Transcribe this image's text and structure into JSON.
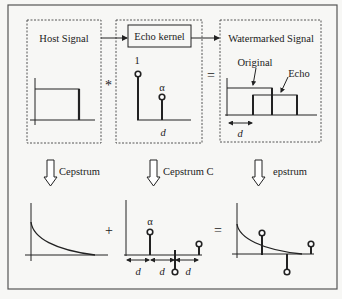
{
  "diagram": {
    "panels": {
      "host": {
        "title": "Host Signal"
      },
      "kernel": {
        "title": "Echo kernel",
        "impulse_1_label": "1",
        "impulse_alpha_label": "α",
        "delay_label": "d"
      },
      "watermarked": {
        "title": "Watermarked Signal",
        "original_label": "Original",
        "echo_label": "Echo",
        "delay_label": "d"
      }
    },
    "operators": {
      "convolve": "*",
      "equals_top": "=",
      "plus": "+",
      "equals_bottom": "="
    },
    "transforms": {
      "left": "Cepstrum",
      "middle": "Cepstrum C",
      "right": "epstrum"
    },
    "cepstrum_kernel": {
      "alpha_label": "α",
      "delay_labels": [
        "d",
        "d",
        "d"
      ]
    },
    "colors": {
      "line": "#222222",
      "dash": "#555555",
      "background": "#f7f7f5",
      "frame": "#555555"
    }
  }
}
